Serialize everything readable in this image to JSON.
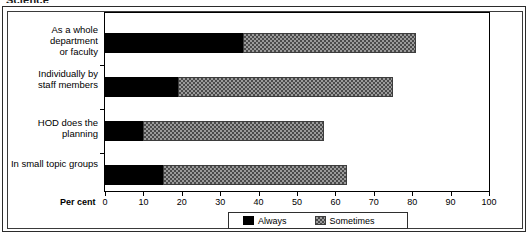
{
  "title": "Science",
  "axis": {
    "x_label": "Per cent",
    "ticks": [
      0,
      10,
      20,
      30,
      40,
      50,
      60,
      70,
      80,
      90,
      100
    ]
  },
  "legend": {
    "always_label": "Always",
    "sometimes_label": "Sometimes",
    "always_color": "#000000",
    "sometimes_color": "#9a9a9a"
  },
  "categories": [
    "As a whole department\nor faculty",
    "Individually by\nstaff members",
    "HOD does the planning",
    "In small topic groups"
  ],
  "chart_data": {
    "type": "bar",
    "orientation": "horizontal",
    "stacked": true,
    "title": "Science",
    "xlabel": "Per cent",
    "ylabel": "",
    "xlim": [
      0,
      100
    ],
    "xticks": [
      0,
      10,
      20,
      30,
      40,
      50,
      60,
      70,
      80,
      90,
      100
    ],
    "grid": false,
    "legend_position": "bottom",
    "categories": [
      "As a whole department or faculty",
      "Individually by staff members",
      "HOD does the planning",
      "In small topic groups"
    ],
    "series": [
      {
        "name": "Always",
        "values": [
          36,
          19,
          10,
          15
        ]
      },
      {
        "name": "Sometimes",
        "values": [
          45,
          56,
          47,
          48
        ]
      }
    ],
    "totals": [
      81,
      75,
      57,
      63
    ]
  }
}
